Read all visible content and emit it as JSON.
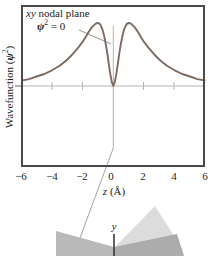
{
  "figure": {
    "annotation": {
      "italic_word": "xy",
      "rest": " nodal plane",
      "psi": "ψ",
      "exp": "2",
      "eq": " = 0"
    },
    "y_axis": {
      "pre": "Wavefunction (",
      "psi": "ψ",
      "exp": "2",
      "post": ")"
    },
    "x_axis": {
      "var": "z",
      "unit": " (Å)",
      "ticks": [
        "−6",
        "−4",
        "−2",
        "0",
        "2",
        "4",
        "6"
      ]
    },
    "inset3d": {
      "y_label": "y"
    },
    "colors": {
      "curve": "#7d6b63",
      "frame": "#4a4a4a",
      "grid": "#b4b4b4",
      "leader": "#999999",
      "plane_left": "#b9b9b9",
      "plane_right": "#acacac",
      "lobe": "#dcdcdc"
    }
  },
  "chart_data": {
    "type": "line",
    "title": "",
    "xlabel": "z (Å)",
    "ylabel": "Wavefunction (ψ²)",
    "xlim": [
      -6,
      6
    ],
    "x_ticks": [
      -6,
      -4,
      -2,
      0,
      2,
      4,
      6
    ],
    "grid": false,
    "annotations": [
      "xy nodal plane",
      "ψ² = 0 at z = 0 (node)"
    ],
    "series": [
      {
        "name": "ψ² of 2p orbital along z",
        "x": [
          -6,
          -5.5,
          -5,
          -4.5,
          -4,
          -3.5,
          -3.25,
          -3,
          -2.75,
          -2.5,
          -2.25,
          -2,
          -1.8,
          -1.6,
          -1.4,
          -1.2,
          -1.1,
          -1,
          -0.9,
          -0.8,
          -0.7,
          -0.6,
          -0.5,
          -0.4,
          -0.3,
          -0.2,
          -0.1,
          0,
          0.1,
          0.2,
          0.3,
          0.4,
          0.5,
          0.6,
          0.7,
          0.8,
          0.9,
          1,
          1.1,
          1.2,
          1.4,
          1.6,
          1.8,
          2,
          2.25,
          2.5,
          2.75,
          3,
          3.25,
          3.5,
          4,
          4.5,
          5,
          5.5,
          6
        ],
        "y": [
          0.085,
          0.11,
          0.15,
          0.19,
          0.25,
          0.32,
          0.37,
          0.42,
          0.48,
          0.55,
          0.62,
          0.7,
          0.78,
          0.86,
          0.93,
          0.98,
          0.995,
          1.0,
          0.99,
          0.955,
          0.89,
          0.8,
          0.68,
          0.53,
          0.36,
          0.2,
          0.06,
          0,
          0.06,
          0.2,
          0.36,
          0.53,
          0.68,
          0.8,
          0.89,
          0.955,
          0.99,
          1.0,
          0.995,
          0.98,
          0.93,
          0.86,
          0.78,
          0.7,
          0.62,
          0.55,
          0.48,
          0.42,
          0.37,
          0.32,
          0.25,
          0.19,
          0.15,
          0.11,
          0.085
        ]
      }
    ]
  }
}
